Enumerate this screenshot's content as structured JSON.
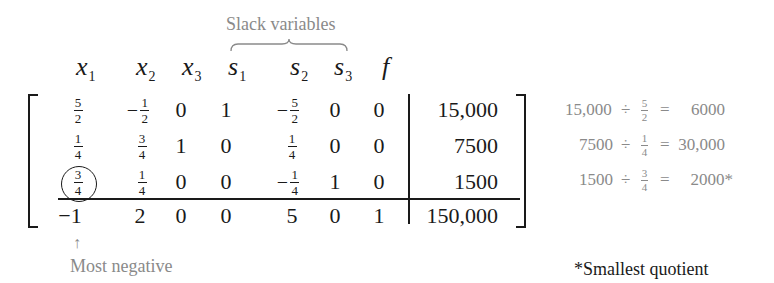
{
  "annotations": {
    "slack_label": "Slack variables",
    "most_negative_arrow": "↑",
    "most_negative_label": "Most negative",
    "smallest_quotient_label": "*Smallest quotient"
  },
  "headers": [
    {
      "var": "x",
      "sub": "1"
    },
    {
      "var": "x",
      "sub": "2"
    },
    {
      "var": "x",
      "sub": "3"
    },
    {
      "var": "s",
      "sub": "1"
    },
    {
      "var": "s",
      "sub": "2"
    },
    {
      "var": "s",
      "sub": "3"
    },
    {
      "var": "f",
      "sub": ""
    }
  ],
  "rows": [
    {
      "cells": [
        {
          "neg": "",
          "num": "5",
          "den": "2"
        },
        {
          "neg": "−",
          "num": "1",
          "den": "2"
        },
        {
          "int": "0"
        },
        {
          "int": "1"
        },
        {
          "neg": "−",
          "num": "5",
          "den": "2"
        },
        {
          "int": "0"
        },
        {
          "int": "0"
        }
      ],
      "rhs": "15,000"
    },
    {
      "cells": [
        {
          "neg": "",
          "num": "1",
          "den": "4"
        },
        {
          "neg": "",
          "num": "3",
          "den": "4"
        },
        {
          "int": "1"
        },
        {
          "int": "0"
        },
        {
          "neg": "",
          "num": "1",
          "den": "4"
        },
        {
          "int": "0"
        },
        {
          "int": "0"
        }
      ],
      "rhs": "7500"
    },
    {
      "cells": [
        {
          "neg": "",
          "num": "3",
          "den": "4"
        },
        {
          "neg": "",
          "num": "1",
          "den": "4"
        },
        {
          "int": "0"
        },
        {
          "int": "0"
        },
        {
          "neg": "−",
          "num": "1",
          "den": "4"
        },
        {
          "int": "1"
        },
        {
          "int": "0"
        }
      ],
      "rhs": "1500"
    },
    {
      "cells": [
        {
          "int": "−1"
        },
        {
          "int": "2"
        },
        {
          "int": "0"
        },
        {
          "int": "0"
        },
        {
          "int": "5"
        },
        {
          "int": "0"
        },
        {
          "int": "1"
        }
      ],
      "rhs": "150,000"
    }
  ],
  "pivot": {
    "row": 3,
    "col": 1
  },
  "quotients": [
    {
      "dividend": "15,000",
      "op": "÷",
      "num": "5",
      "den": "2",
      "eq": "=",
      "result": "6000"
    },
    {
      "dividend": "7500",
      "op": "÷",
      "num": "1",
      "den": "4",
      "eq": "=",
      "result": "30,000"
    },
    {
      "dividend": "1500",
      "op": "÷",
      "num": "3",
      "den": "4",
      "eq": "=",
      "result": "2000*"
    }
  ]
}
